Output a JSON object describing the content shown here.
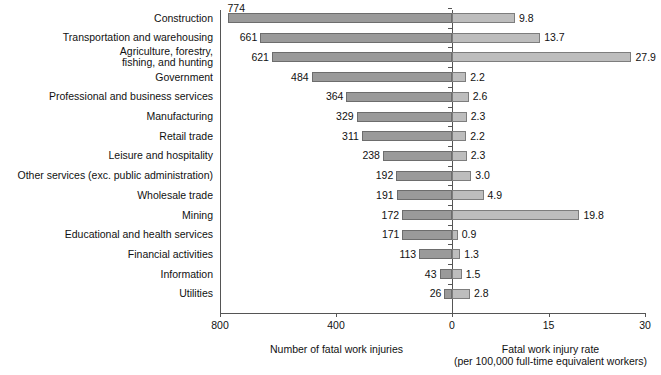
{
  "chart_data": {
    "type": "bar",
    "title": "",
    "subtitle": "",
    "orientation": "horizontal",
    "layout": "bidirectional-paired-panels",
    "grid": false,
    "legend": null,
    "categories": [
      "Construction",
      "Transportation and warehousing",
      "Agriculture, forestry,\nfishing, and hunting",
      "Government",
      "Professional and business services",
      "Manufacturing",
      "Retail trade",
      "Leisure and hospitality",
      "Other services (exc. public administration)",
      "Wholesale trade",
      "Mining",
      "Educational and health services",
      "Financial activities",
      "Information",
      "Utilities"
    ],
    "series": [
      {
        "name": "Number of fatal work injuries",
        "panel": "left",
        "direction": "right-to-left",
        "axis_label": "Number of fatal work injuries",
        "ticks": [
          800,
          400,
          0
        ],
        "tick_labels": [
          "800",
          "400",
          "0"
        ],
        "xlim": [
          800,
          0
        ],
        "values": [
          774,
          661,
          621,
          484,
          364,
          329,
          311,
          238,
          192,
          191,
          172,
          171,
          113,
          43,
          26
        ],
        "value_labels": [
          "774",
          "661",
          "621",
          "484",
          "364",
          "329",
          "311",
          "238",
          "192",
          "191",
          "172",
          "171",
          "113",
          "43",
          "26"
        ],
        "color": "#9a9a9a"
      },
      {
        "name": "Fatal work injury rate (per 100,000 full-time equivalent workers)",
        "panel": "right",
        "direction": "left-to-right",
        "axis_label": "Fatal work injury rate\n(per 100,000 full-time equivalent workers)",
        "ticks": [
          0,
          15,
          30
        ],
        "tick_labels": [
          "0",
          "15",
          "30"
        ],
        "xlim": [
          0,
          30
        ],
        "values": [
          9.8,
          13.7,
          27.9,
          2.2,
          2.6,
          2.3,
          2.2,
          2.3,
          3.0,
          4.9,
          19.8,
          0.9,
          1.3,
          1.5,
          2.8
        ],
        "value_labels": [
          "9.8",
          "13.7",
          "27.9",
          "2.2",
          "2.6",
          "2.3",
          "2.2",
          "2.3",
          "3.0",
          "4.9",
          "19.8",
          "0.9",
          "1.3",
          "1.5",
          "2.8"
        ],
        "color": "#bdbdbd"
      }
    ],
    "colors": {
      "left_bar_fill": "#9a9a9a",
      "left_bar_stroke": "#6d6d6d",
      "right_bar_fill": "#bdbdbd",
      "right_bar_stroke": "#7d7d7d",
      "axis": "#555555",
      "text": "#111111",
      "background": "#ffffff"
    }
  }
}
